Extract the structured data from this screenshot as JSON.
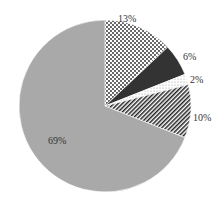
{
  "chart_data": {
    "type": "pie",
    "title": "",
    "start_angle_deg": 90,
    "direction": "clockwise",
    "slices": [
      {
        "label": "13%",
        "value": 13,
        "pattern": "dots",
        "fill": "#ffffff",
        "ink": "#222222"
      },
      {
        "label": "6%",
        "value": 6,
        "pattern": "solid",
        "fill": "#333333",
        "ink": "#333333"
      },
      {
        "label": "2%",
        "value": 2,
        "pattern": "light-dots",
        "fill": "#ffffff",
        "ink": "#888888"
      },
      {
        "label": "10%",
        "value": 10,
        "pattern": "diagonal-stripes",
        "fill": "#ffffff",
        "ink": "#222222"
      },
      {
        "label": "69%",
        "value": 69,
        "pattern": "solid",
        "fill": "#a9a9a9",
        "ink": "#a9a9a9"
      }
    ],
    "values": [
      13,
      6,
      2,
      10,
      69
    ],
    "categories": [
      "13%",
      "6%",
      "2%",
      "10%",
      "69%"
    ]
  },
  "labels": {
    "s0": "13%",
    "s1": "6%",
    "s2": "2%",
    "s3": "10%",
    "s4": "69%"
  }
}
